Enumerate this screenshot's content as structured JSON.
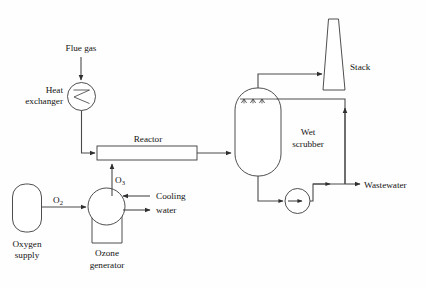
{
  "diagram": {
    "background_color": "#fefefe",
    "line_color": "#3a3a3a",
    "text_color": "#141414",
    "labels": {
      "flue_gas": "Flue gas",
      "heat_exchanger_line1": "Heat",
      "heat_exchanger_line2": "exchanger",
      "reactor": "Reactor",
      "stack": "Stack",
      "wet_scrubber_line1": "Wet",
      "wet_scrubber_line2": "scrubber",
      "wastewater": "Wastewater",
      "oxygen_supply_line1": "Oxygen",
      "oxygen_supply_line2": "supply",
      "ozone_generator_line1": "Ozone",
      "ozone_generator_line2": "generator",
      "cooling_water_line1": "Cooling",
      "cooling_water_line2": "water",
      "oxygen_stream_main": "O",
      "oxygen_stream_sub": "2",
      "ozone_stream_main": "O",
      "ozone_stream_sub": "3"
    },
    "equipment": [
      {
        "id": "heat-exchanger",
        "name": "Heat exchanger",
        "symbol": "circle-with-zigzag"
      },
      {
        "id": "reactor",
        "name": "Reactor",
        "symbol": "horizontal-rectangle"
      },
      {
        "id": "wet-scrubber",
        "name": "Wet scrubber",
        "symbol": "capsule-vessel-with-spray-nozzles"
      },
      {
        "id": "stack",
        "name": "Stack",
        "symbol": "tapered-chimney"
      },
      {
        "id": "oxygen-supply",
        "name": "Oxygen supply",
        "symbol": "capsule-tank"
      },
      {
        "id": "ozone-generator",
        "name": "Ozone generator",
        "symbol": "circle-with-base"
      },
      {
        "id": "pump",
        "name": "Pump",
        "symbol": "circle-with-arrow"
      }
    ],
    "streams": [
      {
        "id": "flue-gas-inlet",
        "label": "Flue gas",
        "from": "inlet",
        "to": "heat-exchanger"
      },
      {
        "id": "heat-exchanger-to-reactor",
        "label": "",
        "from": "heat-exchanger",
        "to": "reactor"
      },
      {
        "id": "oxygen-feed",
        "label": "O2",
        "from": "oxygen-supply",
        "to": "ozone-generator"
      },
      {
        "id": "ozone-feed",
        "label": "O3",
        "from": "ozone-generator",
        "to": "reactor"
      },
      {
        "id": "cooling-water-in",
        "label": "Cooling water",
        "from": "inlet",
        "to": "ozone-generator"
      },
      {
        "id": "cooling-water-out",
        "label": "Cooling water",
        "from": "ozone-generator",
        "to": "outlet"
      },
      {
        "id": "reactor-to-scrubber",
        "label": "",
        "from": "reactor",
        "to": "wet-scrubber"
      },
      {
        "id": "scrubber-to-stack",
        "label": "",
        "from": "wet-scrubber",
        "to": "stack"
      },
      {
        "id": "scrubber-to-pump",
        "label": "",
        "from": "wet-scrubber",
        "to": "pump"
      },
      {
        "id": "pump-to-wastewater",
        "label": "Wastewater",
        "from": "pump",
        "to": "outlet"
      },
      {
        "id": "scrubber-recycle",
        "label": "",
        "from": "wastewater-header",
        "to": "wet-scrubber"
      }
    ]
  }
}
